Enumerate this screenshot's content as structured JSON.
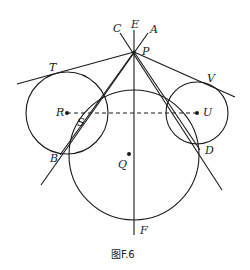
{
  "figure": {
    "caption": "图F.6",
    "labels": {
      "E": "E",
      "C": "C",
      "A": "A",
      "P": "P",
      "T": "T",
      "V": "V",
      "R": "R",
      "S": "S",
      "U": "U",
      "B": "B",
      "D": "D",
      "Q": "Q",
      "F": "F"
    },
    "circles": [
      {
        "name": "circle-R",
        "center": "R"
      },
      {
        "name": "circle-U",
        "center": "U"
      },
      {
        "name": "circle-Q",
        "center": "Q"
      }
    ],
    "segments": [
      "EF",
      "PT",
      "PV",
      "PB (via S)",
      "PD",
      "PA-PC lines",
      "RU (dashed)"
    ]
  }
}
